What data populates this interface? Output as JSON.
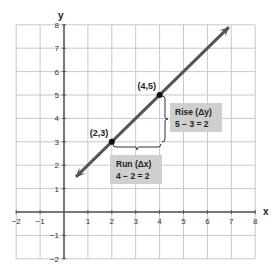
{
  "chart_data": {
    "type": "line",
    "title": "",
    "xlabel": "x",
    "ylabel": "y",
    "xlim": [
      -2,
      8
    ],
    "ylim": [
      -2,
      8
    ],
    "grid": true,
    "x_ticks": [
      "-2",
      "-1",
      "1",
      "2",
      "3",
      "4",
      "5",
      "6",
      "7",
      "8"
    ],
    "y_ticks": [
      "8",
      "7",
      "6",
      "5",
      "4",
      "3",
      "2",
      "1",
      "-1",
      "-2"
    ],
    "line": {
      "description": "Line with slope 1 through (2,3) and (4,5), arrows on both ends",
      "slope": 1,
      "intercept": 1,
      "start": [
        0.5,
        1.5
      ],
      "end": [
        6.9,
        7.9
      ],
      "color": "#555555"
    },
    "points": [
      {
        "label": "(2,3)",
        "x": 2,
        "y": 3
      },
      {
        "label": "(4,5)",
        "x": 4,
        "y": 5
      }
    ],
    "annotations": {
      "rise": {
        "line1": "Rise (Δy)",
        "line2": "5 − 3 = 2"
      },
      "run": {
        "line1": "Run (Δx)",
        "line2": "4 − 2 = 2"
      }
    },
    "colors": {
      "grid": "#c8c8c8",
      "axis": "#555555",
      "box_fill": "#cfcfcf"
    }
  }
}
